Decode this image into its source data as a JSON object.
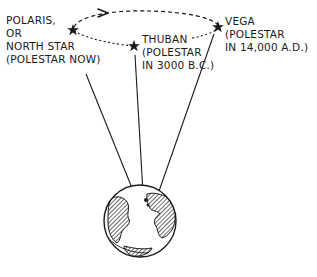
{
  "diagram": {
    "stars": [
      {
        "name": "Polaris",
        "lines": [
          "POLARIS,",
          "OR",
          "NORTH STAR",
          "(POLESTAR NOW)"
        ]
      },
      {
        "name": "Thuban",
        "lines": [
          "THUBAN",
          "(POLESTAR",
          "IN 3000 B.C.)"
        ]
      },
      {
        "name": "Vega",
        "lines": [
          "VEGA",
          "(POLESTAR",
          "IN 14,000 A.D.)"
        ]
      }
    ],
    "icons": {
      "star": "star-icon",
      "earth": "earth-globe-icon",
      "arrow": "precession-direction-arrow-icon"
    },
    "colors": {
      "ink": "#1a1a1a",
      "background": "#ffffff"
    }
  }
}
